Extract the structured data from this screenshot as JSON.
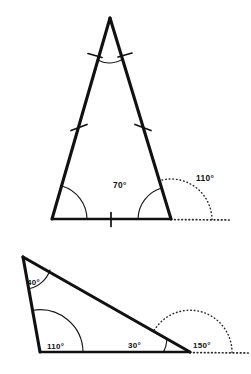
{
  "page": {
    "background_color": "#ffffff",
    "line_color": "#111111",
    "width": 251,
    "height": 374
  },
  "figures": [
    {
      "id": "isosceles-triangle",
      "name": "Isosceles triangle with exterior angle",
      "labels": {
        "interior_right": "70°",
        "exterior_right": "110°"
      },
      "marks": {
        "apex_arc": 1,
        "leg_ticks": 1,
        "base_ticks": 1,
        "base_left_arc": 1
      },
      "geometry": {
        "apex": [
          110,
          18
        ],
        "bottom_left": [
          52,
          219
        ],
        "bottom_right": [
          171,
          219
        ],
        "ray_end": [
          231,
          220
        ]
      }
    },
    {
      "id": "scalene-triangle",
      "name": "Scalene triangle with exterior angle",
      "labels": {
        "top_left": "40°",
        "bottom_left": "110°",
        "interior_right": "30°",
        "exterior_right": "150°"
      },
      "geometry": {
        "top_left": [
          23,
          257
        ],
        "bottom_left": [
          40,
          352
        ],
        "bottom_right": [
          190,
          352
        ],
        "ray_end": [
          250,
          353
        ]
      }
    }
  ]
}
